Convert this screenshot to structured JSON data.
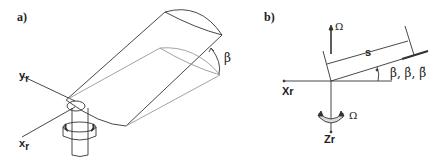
{
  "panel_a": {
    "label": "a)",
    "axis_y": "y",
    "axis_y_sub": "r",
    "axis_x": "x",
    "axis_x_sub": "r",
    "angle": "β"
  },
  "panel_b": {
    "label": "b)",
    "omega_top": "Ω",
    "span": "s",
    "angles": "β, β̇, β̈",
    "axis_x": "Xr",
    "axis_z": "Zr",
    "omega_rot": "Ω"
  }
}
